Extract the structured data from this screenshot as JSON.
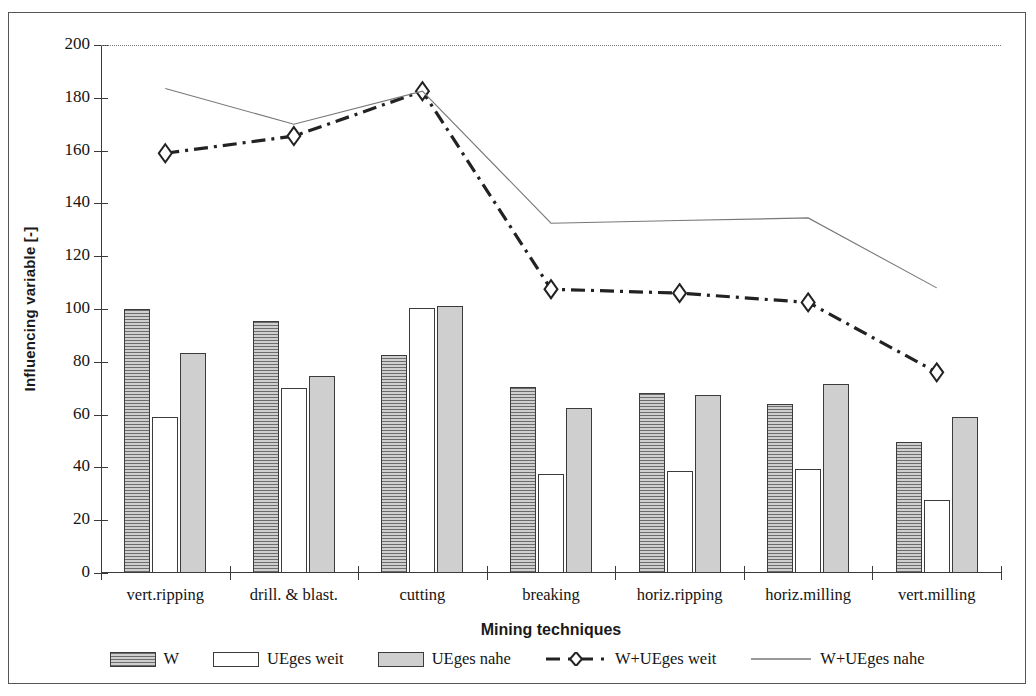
{
  "chart_data": {
    "type": "bar",
    "title": "",
    "xlabel": "Mining techniques",
    "ylabel": "Influencing variable [-]",
    "ylim": [
      0,
      200
    ],
    "ytick_step": 20,
    "yticks": [
      0,
      20,
      40,
      60,
      80,
      100,
      120,
      140,
      160,
      180,
      200
    ],
    "grid": false,
    "legend_position": "bottom",
    "categories": [
      "vert.ripping",
      "drill. & blast.",
      "cutting",
      "breaking",
      "horiz.ripping",
      "horiz.milling",
      "vert.milling"
    ],
    "series": [
      {
        "name": "W",
        "kind": "bar",
        "fill": "dark-hatched",
        "values": [
          100,
          95.5,
          82.5,
          70.5,
          68,
          64,
          49.5
        ]
      },
      {
        "name": "UEges weit",
        "kind": "bar",
        "fill": "white",
        "values": [
          59,
          70,
          100.5,
          37.5,
          38.5,
          39.5,
          27.5
        ]
      },
      {
        "name": "UEges nahe",
        "kind": "bar",
        "fill": "gray",
        "values": [
          83.5,
          74.5,
          101,
          62.5,
          67.5,
          71.5,
          59
        ]
      },
      {
        "name": "W+UEges weit",
        "kind": "line",
        "style": "dash-dot-diamond",
        "values": [
          159,
          165.5,
          182.5,
          107.5,
          106,
          102.5,
          76
        ]
      },
      {
        "name": "W+UEges nahe",
        "kind": "line",
        "style": "thin-solid",
        "values": [
          183.5,
          170,
          182.5,
          132.5,
          133.5,
          134.5,
          108
        ]
      }
    ]
  },
  "axes": {
    "y_title": "Influencing variable [-]",
    "x_title": "Mining techniques"
  },
  "legend": {
    "items": [
      {
        "label": "W",
        "swatch": "bar-dark-hatched"
      },
      {
        "label": "UEges weit",
        "swatch": "bar-white"
      },
      {
        "label": "UEges nahe",
        "swatch": "bar-gray"
      },
      {
        "label": "W+UEges weit",
        "swatch": "line-dash-dot-diamond"
      },
      {
        "label": "W+UEges nahe",
        "swatch": "line-thin-solid"
      }
    ]
  },
  "colors": {
    "axis": "#3a3a3a",
    "bar_w": "#9a9a9a",
    "bar_weit": "#ffffff",
    "bar_nahe": "#cfcfcf",
    "line_weit": "#222222",
    "line_nahe": "#777777"
  }
}
